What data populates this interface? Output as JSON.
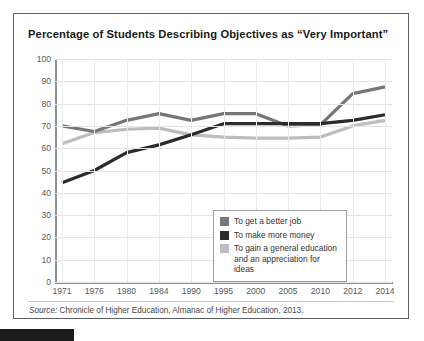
{
  "figure": {
    "title": "Percentage of Students Describing Objectives as “Very Important”",
    "source_prefix": "Source:",
    "source_text": " Chronicle of Higher Education, Almanac of Higher Education, 2013."
  },
  "colors": {
    "series_better_job": "#767676",
    "series_more_money": "#2b2b2b",
    "series_general_education": "#bdbdbd",
    "grid": "#e2e4e6",
    "axis": "#8c9195",
    "frame": "#5a5f63",
    "title_text": "#16191c",
    "tick_text": "#55595c"
  },
  "chart_data": {
    "type": "line",
    "title": "Percentage of Students Describing Objectives as “Very Important”",
    "xlabel": "",
    "ylabel": "",
    "ylim": [
      0,
      100
    ],
    "ytick_step": 10,
    "yticks": [
      100,
      90,
      80,
      70,
      60,
      50,
      40,
      30,
      20,
      10,
      0
    ],
    "categories": [
      "1971",
      "1976",
      "1980",
      "1984",
      "1990",
      "1995",
      "2000",
      "2005",
      "2010",
      "2012",
      "2014"
    ],
    "grid": true,
    "legend_position": "inside-lower-right",
    "series": [
      {
        "name": "To get a better job",
        "color": "#767676",
        "values": [
          70,
          67.5,
          72.5,
          75.5,
          72.5,
          75.5,
          75.5,
          70,
          70.5,
          84.5,
          87.5
        ]
      },
      {
        "name": "To make more money",
        "color": "#2b2b2b",
        "values": [
          44.5,
          50,
          58,
          61.5,
          66,
          71,
          71,
          71,
          71,
          72.5,
          75
        ]
      },
      {
        "name": "To gain a general education and an appreciation for ideas",
        "color": "#bdbdbd",
        "values": [
          62,
          67,
          68.5,
          69,
          66,
          65,
          64.5,
          64.5,
          65,
          70,
          72.5
        ]
      }
    ]
  },
  "legend": {
    "items": [
      {
        "label": "To get a better job",
        "color": "#767676"
      },
      {
        "label": "To make more money",
        "color": "#2b2b2b"
      },
      {
        "label": "To gain a general education and an appreciation for ideas",
        "color": "#bdbdbd"
      }
    ]
  }
}
